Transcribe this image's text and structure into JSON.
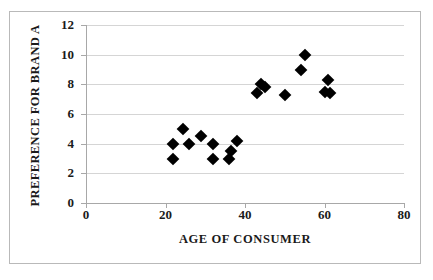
{
  "chart_data": {
    "type": "scatter",
    "title": "",
    "xlabel": "AGE OF CONSUMER",
    "ylabel": "PREFERENCE FOR BRAND A",
    "xlim": [
      0,
      80
    ],
    "ylim": [
      0,
      12
    ],
    "xticks": [
      "0",
      "20",
      "40",
      "60",
      "80"
    ],
    "xtick_values": [
      0,
      20,
      40,
      60,
      80
    ],
    "yticks": [
      "0",
      "2",
      "4",
      "6",
      "8",
      "10",
      "12"
    ],
    "ytick_values": [
      0,
      2,
      4,
      6,
      8,
      10,
      12
    ],
    "grid": "horizontal",
    "legend": "none",
    "marker": "diamond",
    "marker_color": "#000000",
    "series": [
      {
        "name": "Consumers",
        "points": [
          {
            "x": 22,
            "y": 4.0
          },
          {
            "x": 22,
            "y": 3.0
          },
          {
            "x": 24.5,
            "y": 5.0
          },
          {
            "x": 26,
            "y": 4.0
          },
          {
            "x": 29,
            "y": 4.5
          },
          {
            "x": 32,
            "y": 4.0
          },
          {
            "x": 32,
            "y": 3.0
          },
          {
            "x": 36,
            "y": 3.0
          },
          {
            "x": 36.5,
            "y": 3.5
          },
          {
            "x": 38,
            "y": 4.2
          },
          {
            "x": 43,
            "y": 7.4
          },
          {
            "x": 44,
            "y": 8.0
          },
          {
            "x": 45,
            "y": 7.8
          },
          {
            "x": 50,
            "y": 7.3
          },
          {
            "x": 55,
            "y": 10.0
          },
          {
            "x": 54,
            "y": 9.0
          },
          {
            "x": 61,
            "y": 8.3
          },
          {
            "x": 60,
            "y": 7.5
          },
          {
            "x": 61.5,
            "y": 7.4
          }
        ]
      }
    ]
  },
  "colors": {
    "marker": "#000000",
    "gridline": "#d5d5d5",
    "axis": "#a8a8a8",
    "frame": "#b9b9b9",
    "background": "#ffffff",
    "text": "#1a1a1a"
  }
}
